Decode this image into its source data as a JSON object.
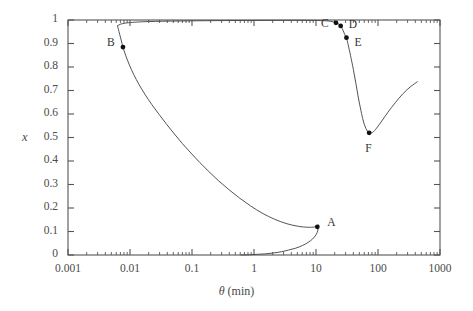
{
  "figure": {
    "background_color": "#ffffff",
    "axis_color": "#555555",
    "curve_color": "#4a4a4a",
    "marker_color": "#111111",
    "text_color": "#3a3a3a"
  },
  "axes": {
    "x_title_symbol": "θ",
    "x_title_unit": "(min)",
    "y_title": "x",
    "x_ticks": [
      "0.001",
      "0.01",
      "0.1",
      "1",
      "10",
      "100",
      "1000"
    ],
    "y_ticks": [
      "0",
      "0.1",
      "0.2",
      "0.3",
      "0.4",
      "0.5",
      "0.6",
      "0.7",
      "0.8",
      "0.9",
      "1"
    ]
  },
  "annotations": [
    {
      "label": "A",
      "theta": 10.5,
      "x": 0.12,
      "label_dx": 10,
      "label_dy": -4
    },
    {
      "label": "B",
      "theta": 0.0077,
      "x": 0.885,
      "label_dx": -16,
      "label_dy": -4
    },
    {
      "label": "C",
      "theta": 21.0,
      "x": 0.988,
      "label_dx": -15,
      "label_dy": 1
    },
    {
      "label": "D",
      "theta": 25.0,
      "x": 0.975,
      "label_dx": 8,
      "label_dy": -1
    },
    {
      "label": "E",
      "theta": 31.0,
      "x": 0.925,
      "label_dx": 8,
      "label_dy": 5
    },
    {
      "label": "F",
      "theta": 72.0,
      "x": 0.52,
      "label_dx": -4,
      "label_dy": 16
    }
  ],
  "chart_data": {
    "type": "line",
    "title": "",
    "xlabel": "θ (min)",
    "ylabel": "x",
    "xscale": "log",
    "yscale": "linear",
    "xlim": [
      0.001,
      1000
    ],
    "ylim": [
      0,
      1
    ],
    "grid": false,
    "legend": "none",
    "xticks": [
      0.001,
      0.01,
      0.1,
      1,
      10,
      100,
      1000
    ],
    "yticks": [
      0,
      0.1,
      0.2,
      0.3,
      0.4,
      0.5,
      0.6,
      0.7,
      0.8,
      0.9,
      1
    ],
    "minor_ticks": true,
    "series": [
      {
        "name": "steady-state hysteresis branch",
        "comment": "S-shaped multivalued curve in theta, traced as a single continuous path",
        "points": [
          [
            0.0063,
            0.975
          ],
          [
            0.0065,
            0.96
          ],
          [
            0.0068,
            0.94
          ],
          [
            0.0072,
            0.915
          ],
          [
            0.0077,
            0.885
          ],
          [
            0.0085,
            0.85
          ],
          [
            0.0098,
            0.808
          ],
          [
            0.0115,
            0.768
          ],
          [
            0.014,
            0.725
          ],
          [
            0.0175,
            0.683
          ],
          [
            0.0225,
            0.64
          ],
          [
            0.0295,
            0.598
          ],
          [
            0.039,
            0.556
          ],
          [
            0.052,
            0.515
          ],
          [
            0.07,
            0.474
          ],
          [
            0.096,
            0.434
          ],
          [
            0.133,
            0.394
          ],
          [
            0.187,
            0.355
          ],
          [
            0.268,
            0.316
          ],
          [
            0.39,
            0.279
          ],
          [
            0.58,
            0.243
          ],
          [
            0.88,
            0.209
          ],
          [
            1.36,
            0.178
          ],
          [
            2.15,
            0.152
          ],
          [
            3.4,
            0.133
          ],
          [
            5.2,
            0.122
          ],
          [
            7.4,
            0.118
          ],
          [
            9.4,
            0.119
          ],
          [
            10.5,
            0.122
          ],
          [
            10.9,
            0.128
          ],
          [
            10.7,
            0.105
          ],
          [
            10.0,
            0.086
          ],
          [
            8.8,
            0.068
          ],
          [
            7.4,
            0.053
          ],
          [
            6.0,
            0.04
          ],
          [
            4.7,
            0.029
          ],
          [
            3.6,
            0.021
          ],
          [
            2.8,
            0.014
          ],
          [
            2.1,
            0.009
          ],
          [
            1.55,
            0.005
          ],
          [
            1.15,
            0.003
          ],
          [
            0.85,
            0.001
          ],
          [
            0.62,
            0.0
          ]
        ],
        "upper_branch_points": [
          [
            0.0063,
            0.975
          ],
          [
            0.007,
            0.982
          ],
          [
            0.0085,
            0.987
          ],
          [
            0.011,
            0.99
          ],
          [
            0.016,
            0.9925
          ],
          [
            0.026,
            0.994
          ],
          [
            0.045,
            0.9952
          ],
          [
            0.085,
            0.9962
          ],
          [
            0.17,
            0.997
          ],
          [
            0.35,
            0.9976
          ],
          [
            0.75,
            0.998
          ],
          [
            1.6,
            0.9983
          ],
          [
            3.4,
            0.9985
          ],
          [
            7.0,
            0.9984
          ],
          [
            12.0,
            0.9975
          ],
          [
            17.0,
            0.9945
          ],
          [
            21.0,
            0.988
          ],
          [
            23.5,
            0.982
          ],
          [
            25.0,
            0.975
          ],
          [
            26.5,
            0.963
          ],
          [
            28.0,
            0.949
          ],
          [
            30.0,
            0.93
          ],
          [
            31.0,
            0.925
          ],
          [
            33.0,
            0.895
          ],
          [
            36.0,
            0.85
          ],
          [
            40.0,
            0.79
          ],
          [
            44.0,
            0.73
          ],
          [
            48.0,
            0.672
          ],
          [
            53.0,
            0.615
          ],
          [
            58.0,
            0.57
          ],
          [
            64.0,
            0.538
          ],
          [
            72.0,
            0.52
          ],
          [
            82.0,
            0.522
          ],
          [
            95.0,
            0.54
          ],
          [
            115.0,
            0.57
          ],
          [
            145.0,
            0.608
          ],
          [
            190.0,
            0.648
          ],
          [
            250.0,
            0.685
          ],
          [
            330.0,
            0.715
          ],
          [
            430.0,
            0.737
          ]
        ]
      }
    ]
  }
}
